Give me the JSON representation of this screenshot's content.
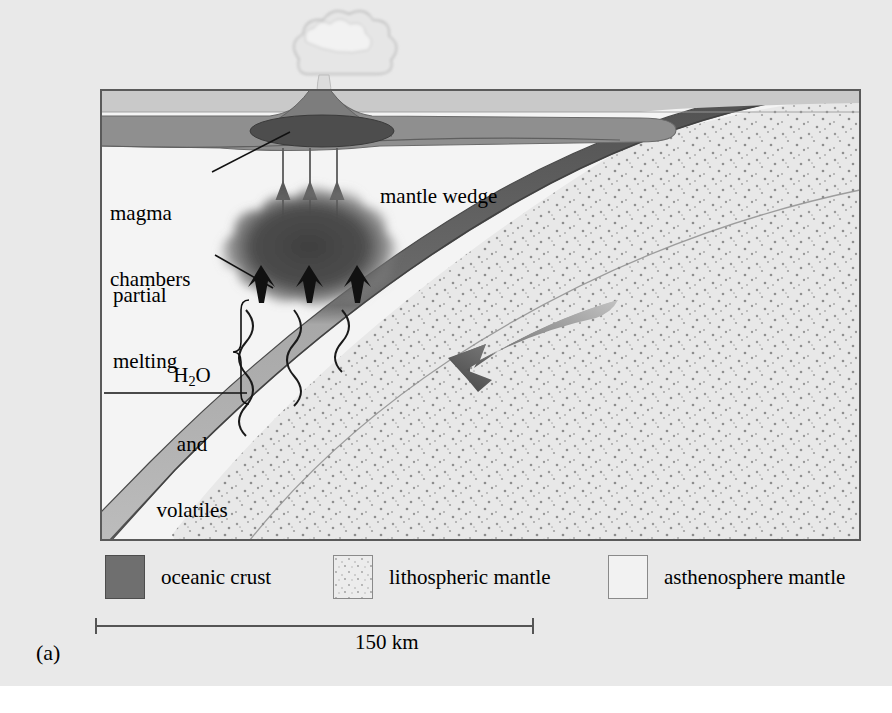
{
  "figure": {
    "panel_label": "(a)",
    "type": "subduction zone cross-section diagram"
  },
  "labels": {
    "magma_chambers_line1": "magma",
    "magma_chambers_line2": "chambers",
    "partial_melting_line1": "partial",
    "partial_melting_line2": "melting",
    "h2o_line1_pre": "H",
    "h2o_line1_sub": "2",
    "h2o_line1_post": "O",
    "h2o_line2": "and",
    "h2o_line3": "volatiles",
    "mantle_wedge": "mantle wedge"
  },
  "legend": {
    "items": [
      {
        "label": "oceanic crust",
        "swatch": "dark-gray-solid",
        "color": "#6f6f6f"
      },
      {
        "label": "lithospheric mantle",
        "swatch": "light-stippled",
        "color": "#ececec"
      },
      {
        "label": "asthenosphere mantle",
        "swatch": "plain-light",
        "color": "#f2f2f2"
      }
    ]
  },
  "scale": {
    "value": "150 km"
  },
  "colors": {
    "page_background": "#e9e9e9",
    "water_layer": "#c9c9c9",
    "arc_crust": "#8c8c8c",
    "oceanic_crust_upper": "#5c5c5c",
    "oceanic_crust_lower": "#9e9e9e",
    "lithosphere": "#e6e6e6",
    "asthenosphere": "#f3f3f3",
    "magma": "#4a4a4a",
    "melt_zone": "#4f4f4f",
    "frame_line": "#555555",
    "eruption_cloud": "#e3e3e3"
  },
  "features": [
    "volcano with eruption plume",
    "elliptical magma chamber",
    "three vertical melt-ascent arrows",
    "partial melting blob",
    "three wavy volatile-release lines",
    "descending oceanic slab",
    "large slab-motion arrow"
  ]
}
